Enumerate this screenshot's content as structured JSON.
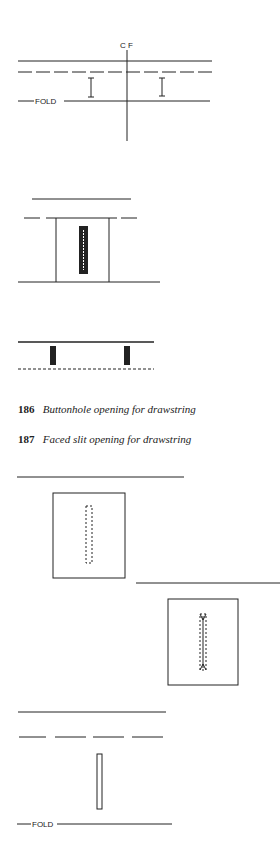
{
  "figures": {
    "fig1": {
      "center_label": "C F",
      "fold_label": "FOLD"
    },
    "fig2": {},
    "fig3": {},
    "fig4": {},
    "fig5": {},
    "fig6": {
      "fold_label": "FOLD"
    }
  },
  "captions": [
    {
      "number": "186",
      "text": "Buttonhole opening for drawstring"
    },
    {
      "number": "187",
      "text": "Faced slit opening for drawstring"
    }
  ],
  "colors": {
    "ink": "#222222",
    "background": "#ffffff"
  }
}
